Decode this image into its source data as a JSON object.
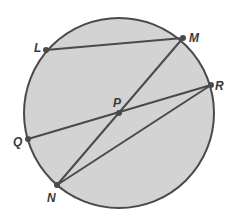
{
  "diagram": {
    "colors": {
      "circle_fill": "#d3d3d3",
      "stroke": "#4a4a4a",
      "point": "#4a4a4a",
      "label": "#3a3a3a"
    },
    "points": [
      {
        "id": "L",
        "label": "L"
      },
      {
        "id": "M",
        "label": "M"
      },
      {
        "id": "R",
        "label": "R"
      },
      {
        "id": "P",
        "label": "P"
      },
      {
        "id": "Q",
        "label": "Q"
      },
      {
        "id": "N",
        "label": "N"
      }
    ],
    "segments": [
      {
        "id": "LM",
        "from": "L",
        "to": "M"
      },
      {
        "id": "MN",
        "from": "M",
        "to": "N"
      },
      {
        "id": "QR",
        "from": "Q",
        "to": "R"
      },
      {
        "id": "NR",
        "from": "N",
        "to": "R"
      }
    ]
  }
}
